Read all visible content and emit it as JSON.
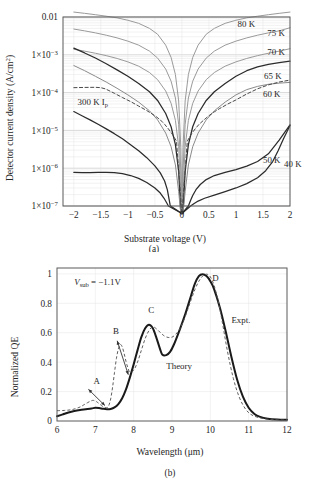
{
  "figure": {
    "panel_a_label": "(a)",
    "panel_b_label": "(b)"
  },
  "chart_data": [
    {
      "id": "panel-a",
      "type": "line",
      "title": "",
      "xlabel": "Substrate voltage (V)",
      "ylabel": "Detector current density (A/cm2)",
      "ylabel_display": "Detector current density (A/cm",
      "ylabel_sup": "2",
      "ylabel_tail": ")",
      "xlim": [
        -2.2,
        2.0
      ],
      "ylim_log": [
        -7,
        -2
      ],
      "yscale": "log",
      "grid": true,
      "xticks": [
        -2,
        -1.5,
        -1,
        -0.5,
        0,
        0.5,
        1,
        1.5,
        2
      ],
      "xticklabels": [
        "−2",
        "−1.5",
        "−1",
        "−0.5",
        "0",
        "0.5",
        "1",
        "1.5",
        "2"
      ],
      "yticks": [
        0.01,
        0.001,
        0.0001,
        1e-05,
        1e-06,
        1e-07
      ],
      "yticklabels": [
        "0.01",
        "1×10",
        "1×10",
        "1×10",
        "1×10",
        "1×10"
      ],
      "ytickexp": [
        "",
        "−3",
        "−4",
        "−5",
        "−6",
        "−7"
      ],
      "annotations": [
        {
          "name": "curve-label-80k",
          "text": "80 K",
          "x": 1.03,
          "y": 0.0053
        },
        {
          "name": "curve-label-75k",
          "text": "75 K",
          "x": 1.58,
          "y": 0.0032
        },
        {
          "name": "curve-label-70k",
          "text": "70 K",
          "x": 1.58,
          "y": 0.00098
        },
        {
          "name": "curve-label-65k",
          "text": "65 K",
          "x": 1.52,
          "y": 0.00023
        },
        {
          "name": "curve-label-60k",
          "text": "60 K",
          "x": 1.5,
          "y": 7.5e-05
        },
        {
          "name": "curve-label-50k",
          "text": "50 K",
          "x": 1.5,
          "y": 1.35e-06
        },
        {
          "name": "curve-label-40k",
          "text": "40 K",
          "x": 1.89,
          "y": 1.05e-06
        },
        {
          "name": "curve-label-300k-ip",
          "text": "300 K I",
          "sub": "p",
          "x": -1.93,
          "y": 4.7e-05
        }
      ],
      "series": [
        {
          "name": "80 K",
          "color": "#9a9a9a",
          "width": 1.0,
          "x": [
            -2,
            -1.8,
            -1.6,
            -1.4,
            -1.2,
            -1.0,
            -0.8,
            -0.6,
            -0.45,
            -0.3,
            -0.2,
            -0.12,
            -0.06,
            -0.02,
            0,
            0.02,
            0.06,
            0.12,
            0.2,
            0.3,
            0.45,
            0.6,
            0.8,
            1.0,
            1.2,
            1.4,
            1.6,
            1.8,
            2.0
          ],
          "y": [
            0.0135,
            0.0125,
            0.0115,
            0.0105,
            0.0095,
            0.0082,
            0.0068,
            0.005,
            0.0035,
            0.0018,
            0.00085,
            0.0003,
            6e-05,
            3.5e-06,
            1e-08,
            3.5e-06,
            6e-05,
            0.0003,
            0.00085,
            0.0018,
            0.0035,
            0.005,
            0.0068,
            0.0082,
            0.0095,
            0.0105,
            0.0115,
            0.0125,
            0.0135
          ]
        },
        {
          "name": "75 K",
          "color": "#9a9a9a",
          "width": 1.0,
          "x": [
            -2,
            -1.8,
            -1.6,
            -1.4,
            -1.2,
            -1.0,
            -0.8,
            -0.6,
            -0.45,
            -0.3,
            -0.2,
            -0.12,
            -0.06,
            -0.02,
            0,
            0.02,
            0.06,
            0.12,
            0.2,
            0.3,
            0.45,
            0.6,
            0.8,
            1.0,
            1.2,
            1.4,
            1.6,
            1.8,
            2.0
          ],
          "y": [
            0.0048,
            0.0043,
            0.0038,
            0.0033,
            0.0028,
            0.0023,
            0.0018,
            0.00125,
            0.00082,
            0.00042,
            0.0002,
            7.2e-05,
            1.45e-05,
            8.5e-07,
            1e-08,
            8.5e-07,
            1.45e-05,
            7.2e-05,
            0.0002,
            0.00042,
            0.00082,
            0.00125,
            0.0018,
            0.0023,
            0.0028,
            0.0033,
            0.0038,
            0.0043,
            0.0052
          ]
        },
        {
          "name": "70 K",
          "color": "#9a9a9a",
          "width": 1.0,
          "x": [
            -2,
            -1.8,
            -1.6,
            -1.4,
            -1.2,
            -1.0,
            -0.8,
            -0.6,
            -0.45,
            -0.3,
            -0.2,
            -0.12,
            -0.06,
            -0.02,
            0,
            0.02,
            0.06,
            0.12,
            0.2,
            0.3,
            0.45,
            0.6,
            0.8,
            1.0,
            1.2,
            1.4,
            1.6,
            1.8,
            2.0
          ],
          "y": [
            0.0014,
            0.00125,
            0.0011,
            0.00095,
            0.0008,
            0.00065,
            0.0005,
            0.00034,
            0.00022,
            0.00011,
            5.2e-05,
            1.85e-05,
            3.7e-06,
            2.2e-07,
            1e-08,
            2.2e-07,
            3.7e-06,
            1.85e-05,
            5.2e-05,
            0.00011,
            0.00022,
            0.00034,
            0.0005,
            0.00065,
            0.0008,
            0.00095,
            0.0011,
            0.00125,
            0.00145
          ]
        },
        {
          "name": "65 K",
          "color": "#2b2b2b",
          "width": 1.25,
          "x": [
            -2,
            -1.8,
            -1.6,
            -1.4,
            -1.2,
            -1.0,
            -0.8,
            -0.6,
            -0.45,
            -0.3,
            -0.2,
            -0.12,
            -0.06,
            -0.02,
            0,
            0.02,
            0.06,
            0.12,
            0.2,
            0.3,
            0.45,
            0.6,
            0.8,
            1.0,
            1.2,
            1.4,
            1.6,
            1.8,
            2.0
          ],
          "y": [
            0.0015,
            0.00112,
            0.00082,
            0.00058,
            0.0004,
            0.00027,
            0.000175,
            0.000105,
            6.2e-05,
            2.8e-05,
            1.25e-05,
            4.2e-06,
            8.2e-07,
            5e-08,
            1e-08,
            5e-08,
            8.2e-07,
            4.2e-06,
            1.25e-05,
            2.8e-05,
            6.2e-05,
            0.000105,
            0.000175,
            0.00027,
            0.00038,
            0.00048,
            0.00056,
            0.00062,
            0.00068
          ]
        },
        {
          "name": "60 K",
          "color": "#8a8a8a",
          "width": 1.0,
          "x": [
            -2,
            -1.8,
            -1.6,
            -1.4,
            -1.2,
            -1.0,
            -0.8,
            -0.6,
            -0.45,
            -0.3,
            -0.2,
            -0.12,
            -0.06,
            -0.02,
            0,
            0.02,
            0.06,
            0.12,
            0.2,
            0.3,
            0.45,
            0.6,
            0.8,
            1.0,
            1.2,
            1.4,
            1.6,
            1.8,
            2.0
          ],
          "y": [
            0.00052,
            0.00038,
            0.00027,
            0.00019,
            0.00013,
            8.7e-05,
            5.6e-05,
            3.3e-05,
            1.9e-05,
            8.5e-06,
            3.7e-06,
            1.22e-06,
            2.4e-07,
            1.5e-08,
            1e-08,
            1.5e-08,
            2.4e-07,
            1.22e-06,
            3.7e-06,
            8.5e-06,
            1.9e-05,
            3.3e-05,
            5.6e-05,
            8.7e-05,
            0.00012,
            0.000146,
            0.000166,
            0.000178,
            0.000186
          ]
        },
        {
          "name": "50 K",
          "color": "#2b2b2b",
          "width": 1.25,
          "x": [
            -2,
            -1.85,
            -1.7,
            -1.55,
            -1.4,
            -1.25,
            -1.1,
            -0.95,
            -0.8,
            -0.65,
            -0.5,
            -0.4,
            -0.32,
            -0.27,
            -0.24,
            -0.22,
            -0.21,
            0,
            0.12,
            0.16,
            0.2,
            0.26,
            0.34,
            0.45,
            0.6,
            0.8,
            1.0,
            1.2,
            1.4,
            1.6,
            1.8,
            2.0
          ],
          "y": [
            3.15e-05,
            2.45e-05,
            1.9e-05,
            1.45e-05,
            1.1e-05,
            8.2e-06,
            6e-06,
            4.2e-06,
            2.9e-06,
            1.9e-06,
            1.15e-06,
            7.5e-07,
            4.6e-07,
            2.7e-07,
            1.6e-07,
            1.1e-07,
            1e-07,
            1e-08,
            1e-07,
            1.4e-07,
            1.9e-07,
            2.7e-07,
            3.7e-07,
            5e-07,
            6.4e-07,
            7.8e-07,
            9.2e-07,
            1.13e-06,
            1.5e-06,
            2.4e-06,
            5.5e-06,
            1.4e-05
          ]
        },
        {
          "name": "40 K",
          "color": "#2b2b2b",
          "width": 1.25,
          "x": [
            -2,
            -1.85,
            -1.7,
            -1.55,
            -1.4,
            -1.25,
            -1.1,
            -0.95,
            -0.8,
            -0.65,
            -0.5,
            -0.4,
            -0.33,
            -0.28,
            -0.25,
            0,
            0.16,
            0.22,
            0.3,
            0.42,
            0.6,
            0.8,
            1.0,
            1.2,
            1.4,
            1.55,
            1.68,
            1.78,
            1.88,
            2.0
          ],
          "y": [
            7.8e-07,
            7.6e-07,
            7.6e-07,
            7.7e-07,
            7.8e-07,
            7.6e-07,
            7.2e-07,
            6.4e-07,
            5.4e-07,
            4.2e-07,
            3e-07,
            2.2e-07,
            1.6e-07,
            1.2e-07,
            1e-07,
            1e-08,
            1e-07,
            1.15e-07,
            1.35e-07,
            1.6e-07,
            1.95e-07,
            2.4e-07,
            3e-07,
            3.9e-07,
            5.6e-07,
            8.6e-07,
            1.5e-06,
            2.9e-06,
            6e-06,
            1.35e-05
          ]
        },
        {
          "name": "300 K Ip",
          "color": "#4a4a4a",
          "width": 1.0,
          "dashed": true,
          "x": [
            -2,
            -1.8,
            -1.6,
            -1.5,
            -1.42,
            -1.35,
            -1.25,
            -1.1,
            -0.95,
            -0.8,
            -0.65,
            -0.5,
            -0.4,
            -0.32,
            -0.25,
            -0.18,
            -0.1,
            0,
            0.1,
            0.18,
            0.25,
            0.32,
            0.4,
            0.5,
            0.6,
            0.7,
            0.85,
            1.0,
            1.2,
            1.4,
            1.6,
            1.8,
            2.0
          ],
          "y": [
            0.000135,
            0.000137,
            0.000138,
            0.000135,
            0.000126,
            0.000113,
            9.6e-05,
            7.4e-05,
            5.8e-05,
            4.4e-05,
            3.35e-05,
            2.45e-05,
            1.9e-05,
            1.45e-05,
            1.1e-05,
            8e-06,
            5.2e-06,
            1e-08,
            5.2e-06,
            8.2e-06,
            1.12e-05,
            1.46e-05,
            1.85e-05,
            2.45e-05,
            3.1e-05,
            3.8e-05,
            5e-05,
            6.4e-05,
            9.2e-05,
            0.000126,
            0.00016,
            0.00019,
            0.000215
          ]
        }
      ]
    },
    {
      "id": "panel-b",
      "type": "line",
      "title": "",
      "xlabel": "Wavelength (μm)",
      "ylabel": "Normalized QE",
      "xlim": [
        6,
        12
      ],
      "ylim": [
        0,
        1.04
      ],
      "grid": true,
      "xticks": [
        6,
        7,
        8,
        9,
        10,
        11,
        12
      ],
      "xticklabels": [
        "6",
        "7",
        "8",
        "9",
        "10",
        "11",
        "12"
      ],
      "yticks": [
        0,
        0.2,
        0.4,
        0.6,
        0.8,
        1
      ],
      "yticklabels": [
        "0",
        "0.2",
        "0.4",
        "0.6",
        "0.8",
        "1"
      ],
      "annotations": [
        {
          "name": "bias-annotation",
          "text": "V",
          "sub": "sub",
          "tail": " = −1.1V",
          "x": 6.45,
          "y": 0.925
        },
        {
          "name": "peak-label-a",
          "text": "A",
          "x": 6.95,
          "y": 0.255
        },
        {
          "name": "peak-label-b",
          "text": "B",
          "x": 7.46,
          "y": 0.595
        },
        {
          "name": "peak-label-c",
          "text": "C",
          "x": 8.38,
          "y": 0.735
        },
        {
          "name": "peak-label-d",
          "text": "D",
          "x": 10.05,
          "y": 0.955
        },
        {
          "name": "legend-expt",
          "text": "Expt.",
          "x": 10.55,
          "y": 0.665
        },
        {
          "name": "legend-theory",
          "text": "Theory",
          "x": 8.85,
          "y": 0.355
        }
      ],
      "series": [
        {
          "name": "Expt.",
          "color": "#1a1a1a",
          "width": 2.0,
          "x": [
            6.0,
            6.15,
            6.3,
            6.45,
            6.6,
            6.75,
            6.9,
            7.0,
            7.1,
            7.2,
            7.3,
            7.4,
            7.5,
            7.6,
            7.7,
            7.8,
            7.9,
            8.0,
            8.1,
            8.2,
            8.3,
            8.4,
            8.5,
            8.6,
            8.7,
            8.75,
            8.85,
            8.95,
            9.05,
            9.2,
            9.35,
            9.5,
            9.6,
            9.7,
            9.8,
            9.9,
            10.0,
            10.1,
            10.25,
            10.4,
            10.55,
            10.7,
            10.85,
            11.0,
            11.15,
            11.3,
            11.5,
            11.75,
            12.0
          ],
          "y": [
            0.032,
            0.045,
            0.058,
            0.068,
            0.075,
            0.08,
            0.085,
            0.09,
            0.088,
            0.083,
            0.08,
            0.082,
            0.092,
            0.115,
            0.155,
            0.215,
            0.295,
            0.385,
            0.48,
            0.57,
            0.63,
            0.655,
            0.63,
            0.56,
            0.48,
            0.45,
            0.448,
            0.47,
            0.52,
            0.62,
            0.73,
            0.855,
            0.935,
            0.985,
            0.998,
            0.985,
            0.95,
            0.895,
            0.77,
            0.61,
            0.435,
            0.28,
            0.165,
            0.09,
            0.048,
            0.028,
            0.016,
            0.01,
            0.008
          ]
        },
        {
          "name": "Theory",
          "color": "#555555",
          "width": 0.95,
          "dashed": true,
          "x": [
            6.0,
            6.2,
            6.4,
            6.6,
            6.7,
            6.8,
            6.9,
            6.95,
            7.0,
            7.05,
            7.1,
            7.2,
            7.3,
            7.35,
            7.4,
            7.45,
            7.5,
            7.55,
            7.6,
            7.65,
            7.7,
            7.75,
            7.8,
            7.85,
            7.9,
            8.0,
            8.1,
            8.2,
            8.3,
            8.4,
            8.5,
            8.6,
            8.7,
            8.8,
            8.9,
            9.0,
            9.1,
            9.2,
            9.3,
            9.4,
            9.5,
            9.6,
            9.7,
            9.8,
            9.9,
            10.0,
            10.1,
            10.2,
            10.3,
            10.45,
            10.6,
            10.75,
            10.9,
            11.05,
            11.25,
            11.5,
            11.75,
            12.0
          ],
          "y": [
            0.07,
            0.072,
            0.078,
            0.095,
            0.11,
            0.125,
            0.138,
            0.14,
            0.136,
            0.128,
            0.118,
            0.098,
            0.09,
            0.105,
            0.15,
            0.23,
            0.33,
            0.425,
            0.49,
            0.52,
            0.505,
            0.46,
            0.405,
            0.36,
            0.335,
            0.345,
            0.4,
            0.48,
            0.56,
            0.615,
            0.64,
            0.625,
            0.6,
            0.578,
            0.568,
            0.57,
            0.59,
            0.625,
            0.68,
            0.75,
            0.825,
            0.895,
            0.95,
            0.985,
            0.998,
            0.98,
            0.92,
            0.82,
            0.69,
            0.47,
            0.29,
            0.165,
            0.088,
            0.046,
            0.024,
            0.012,
            0.008,
            0.006
          ]
        }
      ]
    }
  ]
}
